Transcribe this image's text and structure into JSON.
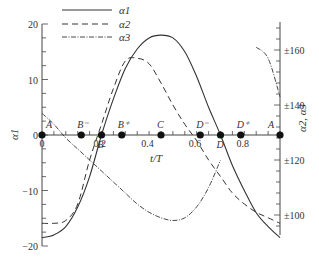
{
  "chart_data": {
    "type": "line",
    "title": "",
    "xlabel": "t/T",
    "ylabel_left": "α1",
    "ylabel_right": "α2, α3",
    "xlim": [
      0,
      1
    ],
    "ylim_left": [
      -20,
      20
    ],
    "ylim_right": [
      90,
      170
    ],
    "x_ticks": [
      "0",
      "0.2",
      "0.4",
      "0.6",
      "0.8"
    ],
    "y_ticks_left": [
      "20",
      "10",
      "0",
      "-10",
      "-20"
    ],
    "y_ticks_right": [
      "±160",
      "±140",
      "±120",
      "±100"
    ],
    "grid": false,
    "legend_position": "top-left",
    "legend": [
      {
        "name": "α1",
        "style": "solid"
      },
      {
        "name": "α2",
        "style": "dashed"
      },
      {
        "name": "α3",
        "style": "dash-dot"
      }
    ],
    "annotations": [
      {
        "label": "A",
        "t": 0.0
      },
      {
        "label": "B⁻",
        "t": 0.165
      },
      {
        "label": "B",
        "t": 0.25
      },
      {
        "label": "B⁺",
        "t": 0.335
      },
      {
        "label": "C",
        "t": 0.5
      },
      {
        "label": "D⁻",
        "t": 0.665
      },
      {
        "label": "D",
        "t": 0.75
      },
      {
        "label": "D⁺",
        "t": 0.835
      },
      {
        "label": "A",
        "t": 1.0
      }
    ],
    "series": [
      {
        "name": "α1",
        "axis": "left",
        "x": [
          0,
          0.05,
          0.1,
          0.15,
          0.2,
          0.25,
          0.3,
          0.35,
          0.4,
          0.45,
          0.5,
          0.55,
          0.6,
          0.65,
          0.7,
          0.75,
          0.8,
          0.85,
          0.9,
          0.95,
          1.0
        ],
        "values": [
          -18.5,
          -18,
          -16.5,
          -13,
          -7.5,
          0,
          6.5,
          12,
          15.5,
          17.5,
          18,
          17.5,
          15,
          10.5,
          5,
          0,
          -5.5,
          -10,
          -14,
          -16.5,
          -18.5
        ]
      },
      {
        "name": "α2",
        "axis": "right",
        "x": [
          0,
          0.05,
          0.1,
          0.15,
          0.2,
          0.25,
          0.3,
          0.35,
          0.4,
          0.45,
          0.5,
          0.55,
          0.6,
          0.65,
          0.7,
          0.75,
          0.8,
          0.85,
          0.9,
          0.95,
          1.0
        ],
        "values": [
          -97,
          -97,
          -98,
          -104,
          -120,
          -133,
          -146,
          -156,
          -157,
          -155,
          -148,
          -140,
          -133,
          -127,
          -120,
          -114,
          -108,
          -104,
          -101,
          -99,
          -97
        ]
      },
      {
        "name": "α3",
        "axis": "right",
        "x": [
          0,
          0.05,
          0.1,
          0.15,
          0.2,
          0.25,
          0.3,
          0.35,
          0.4,
          0.45,
          0.5,
          0.55,
          0.6,
          0.65,
          0.7,
          0.75,
          0.8,
          0.85,
          0.9,
          0.95,
          1.0
        ],
        "values": [
          137,
          133,
          128,
          124,
          120,
          116,
          112,
          108,
          104,
          101,
          99,
          98,
          99,
          103,
          110,
          120,
          null,
          null,
          161,
          157,
          143
        ]
      }
    ]
  }
}
